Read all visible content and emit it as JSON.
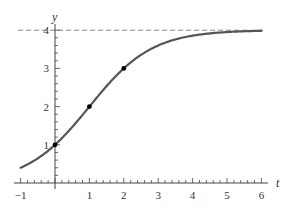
{
  "chart_data": {
    "type": "line",
    "title": "",
    "xlabel": "t",
    "ylabel": "y",
    "xlim": [
      -1,
      6
    ],
    "ylim": [
      0,
      4
    ],
    "x_ticks": [
      -1,
      1,
      2,
      3,
      4,
      5,
      6
    ],
    "y_ticks": [
      1,
      2,
      3,
      4
    ],
    "x_minor_per_unit": 5,
    "y_minor_per_unit": 5,
    "grid": false,
    "series": [
      {
        "name": "logistic curve y = 4/(1+3e^(-t ln3))",
        "function": "logistic",
        "L": 4,
        "A": 3,
        "k": 1.0986,
        "t_range": [
          -1,
          6
        ],
        "color": "#555555"
      }
    ],
    "points": [
      {
        "x": 0,
        "y": 1
      },
      {
        "x": 1,
        "y": 2
      },
      {
        "x": 2,
        "y": 3
      }
    ],
    "asymptote": {
      "y": 4,
      "style": "dashed",
      "color": "#888888"
    }
  },
  "layout": {
    "origin_px": [
      55,
      183
    ],
    "px_per_x": 34.4,
    "px_per_y": 38.2,
    "x_axis_px": [
      14,
      268
    ],
    "y_axis_top_px": 24
  }
}
